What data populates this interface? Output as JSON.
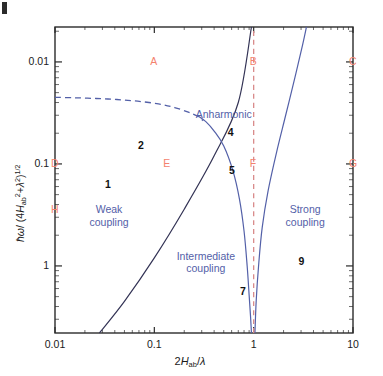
{
  "figure": {
    "corner_mark": "|",
    "axis_x_title": "2Hab/λ",
    "axis_y_title": "ħω/(4H²ab + λ²)^1/2"
  },
  "axes": {
    "x": {
      "label": "2H_ab/λ",
      "ticks": [
        "0.01",
        "0.1",
        "1",
        "10"
      ],
      "tick_values": [
        0.01,
        0.1,
        1,
        10
      ],
      "scale": "log",
      "min": 0.01,
      "max": 10
    },
    "y": {
      "label": "ħω/(4H_ab²+λ²)^(1/2)",
      "ticks": [
        "1",
        "0.1",
        "0.01"
      ],
      "tick_values": [
        1,
        0.1,
        0.01
      ],
      "scale": "log",
      "min": 0.0022,
      "max": 2.2
    }
  },
  "regions": [
    {
      "name": "weak-coupling",
      "text": "Weak\ncoupling",
      "line1": "Weak",
      "line2": "coupling"
    },
    {
      "name": "intermediate-coupling",
      "text": "Intermediate\ncoupling",
      "line1": "Intermediate",
      "line2": "coupling"
    },
    {
      "name": "strong-coupling",
      "text": "Strong\ncoupling",
      "line1": "Strong",
      "line2": "coupling"
    },
    {
      "name": "anharmonic",
      "text": "Anharmonic",
      "line1": "Anharmonic",
      "line2": ""
    }
  ],
  "numbers": [
    {
      "id": "1",
      "label": "1",
      "x": 0.035,
      "y": 0.062
    },
    {
      "id": "2",
      "label": "2",
      "x": 0.075,
      "y": 0.15
    },
    {
      "id": "4",
      "label": "4",
      "x": 0.6,
      "y": 0.2
    },
    {
      "id": "5",
      "label": "5",
      "x": 0.62,
      "y": 0.085
    },
    {
      "id": "7",
      "label": "7",
      "x": 0.8,
      "y": 0.0055
    },
    {
      "id": "9",
      "label": "9",
      "x": 3.1,
      "y": 0.011
    }
  ],
  "markers": [
    {
      "id": "A",
      "label": "A",
      "x": 0.1,
      "y": 1.0
    },
    {
      "id": "B",
      "label": "B",
      "x": 1.0,
      "y": 1.0
    },
    {
      "id": "C",
      "label": "C",
      "x": 10.0,
      "y": 1.0
    },
    {
      "id": "D",
      "label": "D",
      "x": 0.01,
      "y": 0.1
    },
    {
      "id": "E",
      "label": "E",
      "x": 0.135,
      "y": 0.1
    },
    {
      "id": "F",
      "label": "F",
      "x": 1.0,
      "y": 0.1
    },
    {
      "id": "G",
      "label": "G",
      "x": 10.0,
      "y": 0.1
    },
    {
      "id": "H",
      "label": "H",
      "x": 0.01,
      "y": 0.035
    }
  ],
  "colors": {
    "frame": "#2b2b2b",
    "curve_blue": "#5360a8",
    "curve_black": "#333355",
    "dashed_red": "#d98b8b",
    "marker_red": "#f4826e",
    "region_text": "#5360a8",
    "number_text": "#111111",
    "background": "#ffffff"
  },
  "chart_data": {
    "type": "line",
    "title": "",
    "xlabel": "2H_ab/λ",
    "ylabel": "ħω/(4H_ab²+λ²)^(1/2)",
    "xscale": "log",
    "yscale": "log",
    "xlim": [
      0.01,
      10
    ],
    "ylim": [
      0.0022,
      2.2
    ],
    "xticks": [
      0.01,
      0.1,
      1,
      10
    ],
    "yticks": [
      0.01,
      0.1,
      1
    ],
    "grid": false,
    "legend": "none",
    "series": [
      {
        "name": "diagonal-boundary",
        "style": "solid",
        "color": "#333355",
        "comment": "straight line on log-log from lower-left to upper area",
        "x": [
          0.028,
          0.05,
          0.1,
          0.2,
          0.4,
          0.7,
          0.95
        ],
        "y": [
          0.0022,
          0.0045,
          0.012,
          0.036,
          0.12,
          0.4,
          2.2
        ]
      },
      {
        "name": "left-anharmonic-boundary",
        "style": "solid",
        "color": "#5360a8",
        "comment": "curve descending from ~(0.28,0.30) bending down to x~0.95 at bottom",
        "x": [
          0.27,
          0.33,
          0.4,
          0.5,
          0.62,
          0.72,
          0.8,
          0.86,
          0.9,
          0.93,
          0.95
        ],
        "y": [
          0.3,
          0.26,
          0.21,
          0.15,
          0.085,
          0.045,
          0.022,
          0.01,
          0.0052,
          0.0032,
          0.0022
        ]
      },
      {
        "name": "right-anharmonic-boundary",
        "style": "solid",
        "color": "#5360a8",
        "comment": "curve rising from x~1.03 at bottom up to ~(3.4, 2.2)",
        "x": [
          1.03,
          1.06,
          1.12,
          1.22,
          1.4,
          1.7,
          2.1,
          2.6,
          3.1,
          3.4
        ],
        "y": [
          0.0022,
          0.0045,
          0.01,
          0.024,
          0.055,
          0.13,
          0.3,
          0.7,
          1.45,
          2.2
        ]
      },
      {
        "name": "dashed-upper-boundary",
        "style": "dashed",
        "color": "#5360a8",
        "comment": "dashed arc from left axis y~0.45 falling to meet curves near x~0.30",
        "x": [
          0.01,
          0.016,
          0.026,
          0.042,
          0.068,
          0.11,
          0.16,
          0.22,
          0.27,
          0.31
        ],
        "y": [
          0.45,
          0.445,
          0.438,
          0.428,
          0.412,
          0.388,
          0.357,
          0.322,
          0.295,
          0.265
        ]
      },
      {
        "name": "vertical-dashed-marker",
        "style": "dashed",
        "color": "#d98b8b",
        "comment": "vertical dashed line at x = 1",
        "x": [
          1.0,
          1.0
        ],
        "y": [
          0.0022,
          2.2
        ]
      }
    ],
    "annotations": [
      {
        "text": "Weak coupling",
        "x": 0.035,
        "y": 0.03
      },
      {
        "text": "Intermediate coupling",
        "x": 0.33,
        "y": 0.0105
      },
      {
        "text": "Strong coupling",
        "x": 3.3,
        "y": 0.03
      },
      {
        "text": "Anharmonic",
        "x": 0.5,
        "y": 0.3
      },
      {
        "text": "1",
        "x": 0.035,
        "y": 0.062
      },
      {
        "text": "2",
        "x": 0.075,
        "y": 0.15
      },
      {
        "text": "4",
        "x": 0.6,
        "y": 0.2
      },
      {
        "text": "5",
        "x": 0.62,
        "y": 0.085
      },
      {
        "text": "7",
        "x": 0.8,
        "y": 0.0055
      },
      {
        "text": "9",
        "x": 3.1,
        "y": 0.011
      },
      {
        "text": "A",
        "x": 0.1,
        "y": 1.0
      },
      {
        "text": "B",
        "x": 1.0,
        "y": 1.0
      },
      {
        "text": "C",
        "x": 10.0,
        "y": 1.0
      },
      {
        "text": "D",
        "x": 0.01,
        "y": 0.1
      },
      {
        "text": "E",
        "x": 0.135,
        "y": 0.1
      },
      {
        "text": "F",
        "x": 1.0,
        "y": 0.1
      },
      {
        "text": "G",
        "x": 10.0,
        "y": 0.1
      },
      {
        "text": "H",
        "x": 0.01,
        "y": 0.035
      }
    ]
  }
}
